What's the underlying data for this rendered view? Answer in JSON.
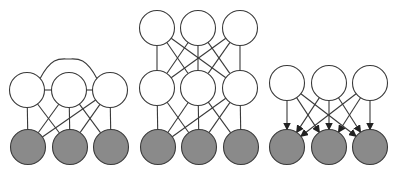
{
  "colors": {
    "background": "#ffffff",
    "stroke": "#3a3a3a",
    "hidden_fill": "#ffffff",
    "observed_fill": "#8a8a8a"
  },
  "diagrams": [
    {
      "id": "undirected-lateral",
      "description": "Single hidden layer with lateral connections, undirected to observed layer",
      "radius": 17.5,
      "nodes": [
        {
          "id": "h1",
          "type": "hidden",
          "cx": 27,
          "cy": 90
        },
        {
          "id": "h2",
          "type": "hidden",
          "cx": 69,
          "cy": 90
        },
        {
          "id": "h3",
          "type": "hidden",
          "cx": 110,
          "cy": 90
        },
        {
          "id": "v1",
          "type": "observed",
          "cx": 28,
          "cy": 147
        },
        {
          "id": "v2",
          "type": "observed",
          "cx": 70,
          "cy": 147
        },
        {
          "id": "v3",
          "type": "observed",
          "cx": 111,
          "cy": 147
        }
      ],
      "edges": [
        [
          "h1",
          "h2"
        ],
        [
          "h2",
          "h3"
        ],
        [
          "h1",
          "v1"
        ],
        [
          "h1",
          "v2"
        ],
        [
          "h2",
          "v1"
        ],
        [
          "h2",
          "v2"
        ],
        [
          "h2",
          "v3"
        ],
        [
          "h3",
          "v1"
        ],
        [
          "h3",
          "v2"
        ],
        [
          "h3",
          "v3"
        ]
      ],
      "arcs": [
        {
          "from": "h1",
          "to": "h3",
          "peak_y": 59
        }
      ],
      "directed": false
    },
    {
      "id": "deep-undirected",
      "description": "Two hidden layers, undirected",
      "radius": 17.5,
      "nodes": [
        {
          "id": "t1",
          "type": "hidden",
          "cx": 157,
          "cy": 28
        },
        {
          "id": "t2",
          "type": "hidden",
          "cx": 198,
          "cy": 28
        },
        {
          "id": "t3",
          "type": "hidden",
          "cx": 240,
          "cy": 28
        },
        {
          "id": "m1",
          "type": "hidden",
          "cx": 157,
          "cy": 88
        },
        {
          "id": "m2",
          "type": "hidden",
          "cx": 198,
          "cy": 88
        },
        {
          "id": "m3",
          "type": "hidden",
          "cx": 240,
          "cy": 88
        },
        {
          "id": "b1",
          "type": "observed",
          "cx": 158,
          "cy": 147
        },
        {
          "id": "b2",
          "type": "observed",
          "cx": 199,
          "cy": 147
        },
        {
          "id": "b3",
          "type": "observed",
          "cx": 241,
          "cy": 147
        }
      ],
      "edges": [
        [
          "t1",
          "m1"
        ],
        [
          "t1",
          "m2"
        ],
        [
          "t1",
          "m3"
        ],
        [
          "t2",
          "m1"
        ],
        [
          "t2",
          "m2"
        ],
        [
          "t2",
          "m3"
        ],
        [
          "t3",
          "m1"
        ],
        [
          "t3",
          "m2"
        ],
        [
          "t3",
          "m3"
        ],
        [
          "m1",
          "b1"
        ],
        [
          "m1",
          "b2"
        ],
        [
          "m2",
          "b1"
        ],
        [
          "m2",
          "b2"
        ],
        [
          "m2",
          "b3"
        ],
        [
          "m3",
          "b1"
        ],
        [
          "m3",
          "b2"
        ],
        [
          "m3",
          "b3"
        ]
      ],
      "arcs": [],
      "directed": false
    },
    {
      "id": "directed",
      "description": "Single hidden layer with directed edges to observed layer",
      "radius": 17.5,
      "nodes": [
        {
          "id": "h1",
          "type": "hidden",
          "cx": 287,
          "cy": 83
        },
        {
          "id": "h2",
          "type": "hidden",
          "cx": 329,
          "cy": 83
        },
        {
          "id": "h3",
          "type": "hidden",
          "cx": 370,
          "cy": 83
        },
        {
          "id": "v1",
          "type": "observed",
          "cx": 287,
          "cy": 147
        },
        {
          "id": "v2",
          "type": "observed",
          "cx": 329,
          "cy": 147
        },
        {
          "id": "v3",
          "type": "observed",
          "cx": 370,
          "cy": 147
        }
      ],
      "edges": [
        [
          "h1",
          "v1"
        ],
        [
          "h1",
          "v2"
        ],
        [
          "h1",
          "v3"
        ],
        [
          "h2",
          "v1"
        ],
        [
          "h2",
          "v2"
        ],
        [
          "h2",
          "v3"
        ],
        [
          "h3",
          "v1"
        ],
        [
          "h3",
          "v2"
        ],
        [
          "h3",
          "v3"
        ]
      ],
      "arcs": [],
      "directed": true
    }
  ]
}
